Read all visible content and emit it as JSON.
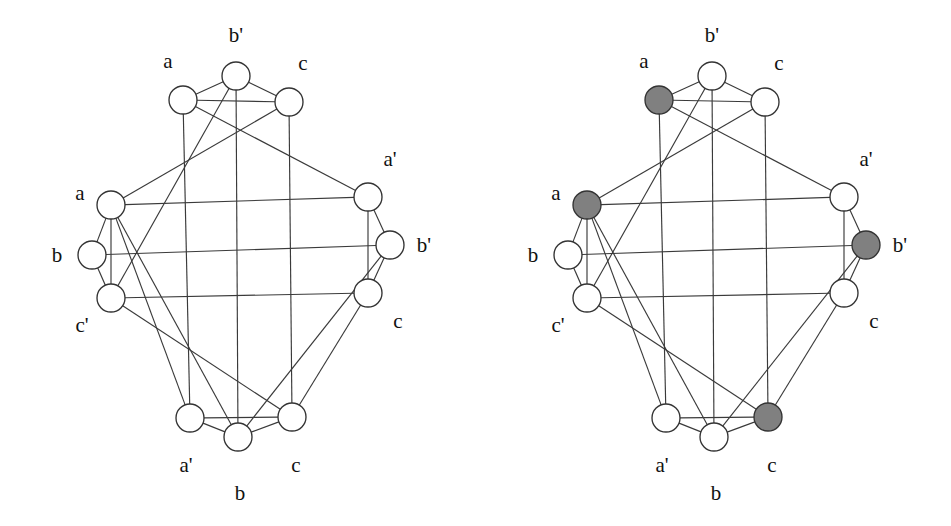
{
  "figure": {
    "panel_count": 2,
    "background_color": "#ffffff",
    "edge_color": "#3a3a3a",
    "node_outline_color": "#333333",
    "node_fill_plain": "#ffffff",
    "node_fill_shaded": "#808080",
    "node_radius": 14
  },
  "panels": [
    {
      "id": "left-graph",
      "name": "uncolored-graph",
      "shaded_node_ids": []
    },
    {
      "id": "right-graph",
      "name": "graph-with-shaded-independent-set",
      "shaded_node_ids": [
        "t_a",
        "l_a",
        "r_bp",
        "bo_c"
      ]
    }
  ],
  "graph": {
    "nodes": [
      {
        "id": "t_a",
        "label": "a",
        "cluster": "top",
        "x": 183,
        "y": 100,
        "label_x": 168,
        "label_y": 68,
        "label_anchor": "middle"
      },
      {
        "id": "t_bp",
        "label": "b'",
        "cluster": "top",
        "x": 236,
        "y": 76,
        "label_x": 236,
        "label_y": 42,
        "label_anchor": "middle"
      },
      {
        "id": "t_c",
        "label": "c",
        "cluster": "top",
        "x": 289,
        "y": 102,
        "label_x": 303,
        "label_y": 70,
        "label_anchor": "middle"
      },
      {
        "id": "l_a",
        "label": "a",
        "cluster": "left",
        "x": 111,
        "y": 205,
        "label_x": 80,
        "label_y": 200,
        "label_anchor": "middle"
      },
      {
        "id": "l_b",
        "label": "b",
        "cluster": "left",
        "x": 92,
        "y": 255,
        "label_x": 57,
        "label_y": 262,
        "label_anchor": "middle"
      },
      {
        "id": "l_cp",
        "label": "c'",
        "cluster": "left",
        "x": 111,
        "y": 298,
        "label_x": 82,
        "label_y": 332,
        "label_anchor": "middle"
      },
      {
        "id": "r_ap",
        "label": "a'",
        "cluster": "right",
        "x": 368,
        "y": 197,
        "label_x": 390,
        "label_y": 166,
        "label_anchor": "middle"
      },
      {
        "id": "r_bp",
        "label": "b'",
        "cluster": "right",
        "x": 390,
        "y": 245,
        "label_x": 424,
        "label_y": 252,
        "label_anchor": "middle"
      },
      {
        "id": "r_c",
        "label": "c",
        "cluster": "right",
        "x": 368,
        "y": 293,
        "label_x": 398,
        "label_y": 328,
        "label_anchor": "middle"
      },
      {
        "id": "bo_ap",
        "label": "a'",
        "cluster": "bottom",
        "x": 190,
        "y": 418,
        "label_x": 186,
        "label_y": 472,
        "label_anchor": "middle"
      },
      {
        "id": "bo_b",
        "label": "b",
        "cluster": "bottom",
        "x": 238,
        "y": 437,
        "label_x": 240,
        "label_y": 500,
        "label_anchor": "middle"
      },
      {
        "id": "bo_c",
        "label": "c",
        "cluster": "bottom",
        "x": 292,
        "y": 417,
        "label_x": 296,
        "label_y": 472,
        "label_anchor": "middle"
      }
    ],
    "edges": [
      {
        "from": "t_a",
        "to": "t_bp"
      },
      {
        "from": "t_a",
        "to": "t_c"
      },
      {
        "from": "t_bp",
        "to": "t_c"
      },
      {
        "from": "l_a",
        "to": "l_b"
      },
      {
        "from": "l_a",
        "to": "l_cp"
      },
      {
        "from": "l_b",
        "to": "l_cp"
      },
      {
        "from": "r_ap",
        "to": "r_bp"
      },
      {
        "from": "r_ap",
        "to": "r_c"
      },
      {
        "from": "r_bp",
        "to": "r_c"
      },
      {
        "from": "bo_ap",
        "to": "bo_b"
      },
      {
        "from": "bo_ap",
        "to": "bo_c"
      },
      {
        "from": "bo_b",
        "to": "bo_c"
      },
      {
        "from": "t_a",
        "to": "bo_ap"
      },
      {
        "from": "t_bp",
        "to": "bo_b"
      },
      {
        "from": "t_bp",
        "to": "l_cp"
      },
      {
        "from": "t_a",
        "to": "r_ap"
      },
      {
        "from": "t_c",
        "to": "l_a"
      },
      {
        "from": "t_c",
        "to": "bo_c"
      },
      {
        "from": "l_a",
        "to": "r_ap"
      },
      {
        "from": "l_b",
        "to": "r_bp"
      },
      {
        "from": "l_cp",
        "to": "r_c"
      },
      {
        "from": "l_a",
        "to": "bo_ap"
      },
      {
        "from": "l_a",
        "to": "bo_b"
      },
      {
        "from": "l_cp",
        "to": "bo_c"
      },
      {
        "from": "r_bp",
        "to": "bo_b"
      },
      {
        "from": "r_c",
        "to": "bo_c"
      }
    ]
  }
}
